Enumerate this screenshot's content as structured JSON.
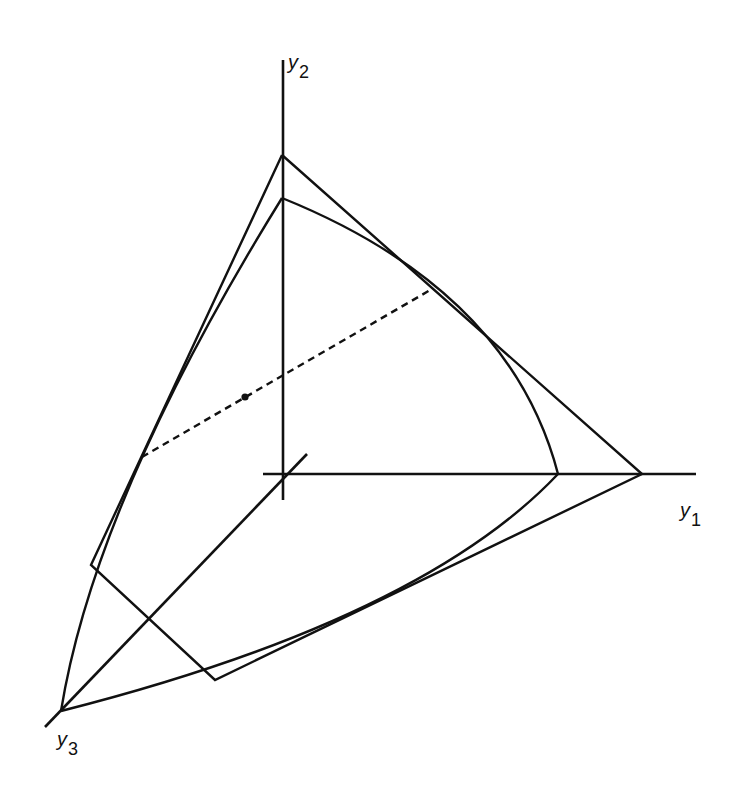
{
  "diagram": {
    "type": "3d-coordinate-figure",
    "axes": {
      "y1": {
        "base": "y",
        "subscript": "1"
      },
      "y2": {
        "base": "y",
        "subscript": "2"
      },
      "y3": {
        "base": "y",
        "subscript": "3"
      }
    },
    "elements": [
      {
        "name": "outer-simplex-polygon",
        "style": "solid"
      },
      {
        "name": "curved-surface-boundary",
        "style": "solid"
      },
      {
        "name": "tangent-chord",
        "style": "dashed"
      },
      {
        "name": "center-point",
        "style": "dot"
      }
    ],
    "colors": {
      "ink": "#111111",
      "background": "#ffffff"
    }
  }
}
